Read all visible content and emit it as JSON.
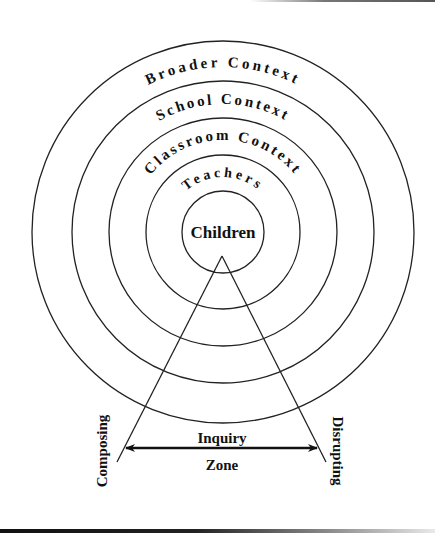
{
  "diagram": {
    "rings": [
      {
        "label": "Broader Context",
        "radius": 191
      },
      {
        "label": "School Context",
        "radius": 151
      },
      {
        "label": "Classroom Context",
        "radius": 114
      },
      {
        "label": "Teachers",
        "radius": 77
      },
      {
        "label": "Children",
        "radius": 41
      }
    ],
    "center_label": "Children",
    "inquiry_zone": {
      "top_label": "Inquiry",
      "bottom_label": "Zone"
    },
    "left_label": "Composing",
    "right_label": "Disrupting",
    "colors": {
      "stroke": "#222222",
      "text": "#111111",
      "background": "#ffffff"
    }
  }
}
